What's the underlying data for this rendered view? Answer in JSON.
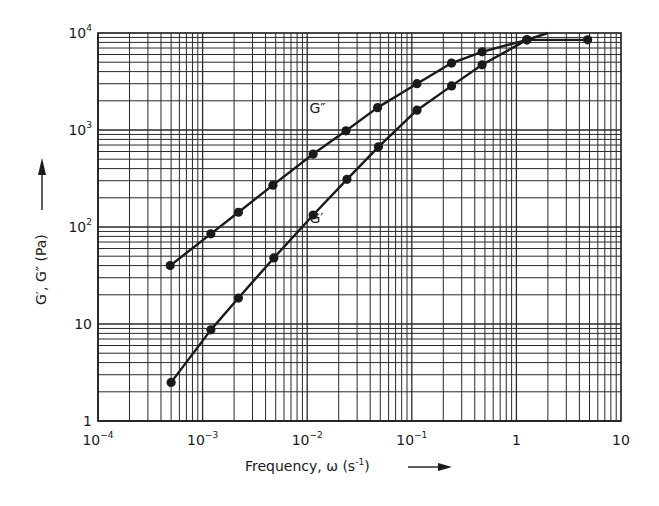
{
  "chart_data": {
    "type": "line",
    "title": "",
    "xlabel": "Frequency, ω (s⁻¹)",
    "ylabel": "G′, G″ (Pa)",
    "xscale": "log",
    "yscale": "log",
    "xlim": [
      0.0001,
      10
    ],
    "ylim": [
      1,
      10000
    ],
    "grid": true,
    "grid_style": "log major + minor (2–9)",
    "x_tick_labels": [
      "10^-4",
      "10^-3",
      "10^-2",
      "10^-1",
      "1",
      "10"
    ],
    "y_tick_labels": [
      "1",
      "10",
      "10^2",
      "10^3",
      "10^4"
    ],
    "legend": "inline labels",
    "series": [
      {
        "name": "G″",
        "label_position": {
          "x": 0.0105,
          "y": 1480
        },
        "x": [
          0.00049,
          0.0012,
          0.0022,
          0.0047,
          0.0114,
          0.0235,
          0.047,
          0.112,
          0.24,
          0.47,
          1.26
        ],
        "y": [
          40,
          85,
          142,
          270,
          565,
          980,
          1700,
          3000,
          4900,
          6400,
          8500
        ],
        "continues_to": {
          "x": 2.0,
          "y": 10000
        }
      },
      {
        "name": "G′",
        "label_position": {
          "x": 0.0105,
          "y": 110
        },
        "x": [
          0.0005,
          0.0012,
          0.0022,
          0.0048,
          0.0114,
          0.024,
          0.048,
          0.112,
          0.24,
          0.47,
          1.26,
          4.8
        ],
        "y": [
          2.5,
          8.7,
          18.5,
          48,
          133,
          310,
          670,
          1600,
          2850,
          4700,
          8500,
          8500
        ]
      }
    ]
  },
  "axes": {
    "x_title": "Frequency, ω (s",
    "x_title_sup": "-1",
    "x_title_end": ")",
    "y_title": "G′, G″ (Pa)"
  },
  "colors": {
    "line": "#1a1a1a",
    "grid": "#2a2a2a",
    "background": "#ffffff"
  }
}
